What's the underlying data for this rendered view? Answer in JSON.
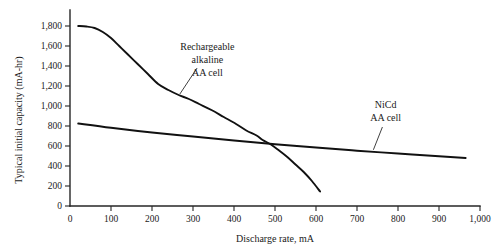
{
  "chart_data": {
    "type": "line",
    "title": "",
    "xlabel": "Discharge rate, mA",
    "ylabel": "Typical initial capacity (mA-hr)",
    "xlim": [
      0,
      1000
    ],
    "ylim": [
      0,
      1800
    ],
    "grid": false,
    "legend_position": "inline-annotations",
    "xticks": [
      0,
      100,
      200,
      300,
      400,
      500,
      600,
      700,
      800,
      900,
      1000
    ],
    "xtick_labels": [
      "0",
      "100",
      "200",
      "300",
      "400",
      "500",
      "600",
      "700",
      "800",
      "900",
      "1,000"
    ],
    "yticks": [
      0,
      200,
      400,
      600,
      800,
      1000,
      1200,
      1400,
      1600,
      1800
    ],
    "ytick_labels": [
      "0",
      "200",
      "400",
      "600",
      "800",
      "1,000",
      "1,200",
      "1,400",
      "1,600",
      "1,800"
    ],
    "series": [
      {
        "name": "Rechargeable alkaline AA cell",
        "points": [
          [
            20,
            1800
          ],
          [
            40,
            1795
          ],
          [
            60,
            1780
          ],
          [
            80,
            1740
          ],
          [
            100,
            1680
          ],
          [
            120,
            1600
          ],
          [
            140,
            1520
          ],
          [
            165,
            1420
          ],
          [
            190,
            1320
          ],
          [
            215,
            1220
          ],
          [
            240,
            1160
          ],
          [
            265,
            1110
          ],
          [
            290,
            1070
          ],
          [
            315,
            1020
          ],
          [
            345,
            960
          ],
          [
            375,
            890
          ],
          [
            405,
            820
          ],
          [
            430,
            755
          ],
          [
            455,
            705
          ],
          [
            470,
            660
          ],
          [
            490,
            615
          ],
          [
            510,
            555
          ],
          [
            530,
            490
          ],
          [
            550,
            415
          ],
          [
            570,
            340
          ],
          [
            590,
            250
          ],
          [
            610,
            145
          ]
        ]
      },
      {
        "name": "NiCd AA cell",
        "points": [
          [
            20,
            825
          ],
          [
            100,
            782
          ],
          [
            200,
            735
          ],
          [
            300,
            695
          ],
          [
            400,
            655
          ],
          [
            500,
            618
          ],
          [
            600,
            585
          ],
          [
            700,
            553
          ],
          [
            800,
            525
          ],
          [
            900,
            498
          ],
          [
            965,
            480
          ]
        ]
      }
    ],
    "annotations": [
      {
        "name": "alkaline-label",
        "lines": [
          "Rechargeable",
          "alkaline",
          "AA cell"
        ],
        "text_x": 335,
        "text_y": 1565,
        "leader_from": [
          310,
          1380
        ],
        "leader_to": [
          268,
          1120
        ]
      },
      {
        "name": "nicd-label",
        "lines": [
          "NiCd",
          "AA cell"
        ],
        "text_x": 770,
        "text_y": 980,
        "leader_from": [
          762,
          790
        ],
        "leader_to": [
          740,
          562
        ]
      }
    ],
    "colors": {
      "axis": "#262626",
      "series_line": "#111111",
      "background": "#ffffff",
      "text": "#1a1a1a"
    }
  }
}
